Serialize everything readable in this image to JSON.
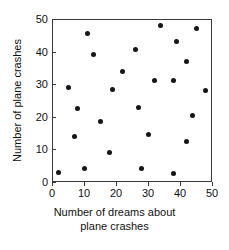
{
  "chart_data": {
    "type": "scatter",
    "title": "",
    "xlabel": "Number of dreams about plane crashes",
    "ylabel": "Number of plane crashes",
    "xlim": [
      0,
      50
    ],
    "ylim": [
      0,
      50
    ],
    "xticks": [
      0,
      10,
      20,
      30,
      40,
      50
    ],
    "yticks": [
      0,
      10,
      20,
      30,
      40,
      50
    ],
    "grid": false,
    "legend": null,
    "marker": {
      "shape": "circle",
      "color": "#161616",
      "size_px": 5
    },
    "points": [
      {
        "x": 2,
        "y": 3
      },
      {
        "x": 5,
        "y": 29
      },
      {
        "x": 7,
        "y": 14
      },
      {
        "x": 8,
        "y": 22.5
      },
      {
        "x": 10,
        "y": 4
      },
      {
        "x": 11,
        "y": 45.5
      },
      {
        "x": 13,
        "y": 39
      },
      {
        "x": 15,
        "y": 18.5
      },
      {
        "x": 18,
        "y": 9
      },
      {
        "x": 19,
        "y": 28.5
      },
      {
        "x": 22,
        "y": 34
      },
      {
        "x": 26,
        "y": 40.5
      },
      {
        "x": 27,
        "y": 23
      },
      {
        "x": 28,
        "y": 4
      },
      {
        "x": 30,
        "y": 14.5
      },
      {
        "x": 32,
        "y": 31
      },
      {
        "x": 34,
        "y": 48
      },
      {
        "x": 38,
        "y": 2.5
      },
      {
        "x": 38,
        "y": 31
      },
      {
        "x": 39,
        "y": 43
      },
      {
        "x": 42,
        "y": 12.5
      },
      {
        "x": 42,
        "y": 37
      },
      {
        "x": 44,
        "y": 20.5
      },
      {
        "x": 45,
        "y": 47
      },
      {
        "x": 48,
        "y": 28
      }
    ]
  },
  "axis": {
    "x_title_line1": "Number of dreams about",
    "x_title_line2": "plane crashes",
    "y_title": "Number of plane crashes"
  }
}
